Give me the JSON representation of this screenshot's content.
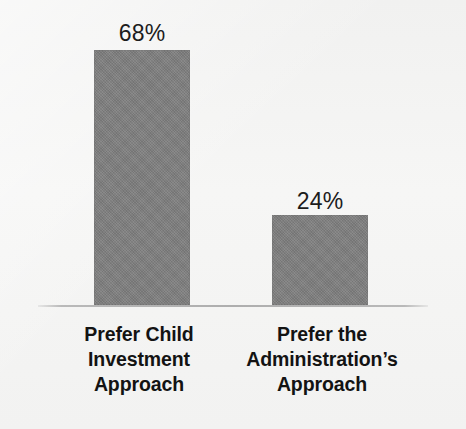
{
  "chart_data": {
    "type": "bar",
    "title": "",
    "subtitle": "",
    "xlabel": "",
    "ylabel": "",
    "ylim": [
      0,
      100
    ],
    "grid": false,
    "legend": "none",
    "orientation": "vertical",
    "categories": [
      "Prefer Child Investment Approach",
      "Prefer the Administration’s Approach"
    ],
    "values": [
      68,
      24
    ],
    "value_labels": [
      "68%",
      "24%"
    ],
    "units": "percent",
    "series": [
      {
        "name": "",
        "values": [
          68,
          24
        ]
      }
    ],
    "annotations": []
  },
  "colors": {
    "background": "#f4f4f3",
    "bar_fill": "#7e7e7e",
    "axis_line": "#aeaeae",
    "label_text": "#131313",
    "value_text": "#1c1c1c"
  },
  "bars": [
    {
      "name": "bar-prefer-child-investment-approach",
      "value_label": "68%",
      "category_lines": [
        "Prefer Child",
        "Investment",
        "Approach"
      ]
    },
    {
      "name": "bar-prefer-the-administrations-approach",
      "value_label": "24%",
      "category_lines": [
        "Prefer the",
        "Administration’s",
        "Approach"
      ]
    }
  ]
}
